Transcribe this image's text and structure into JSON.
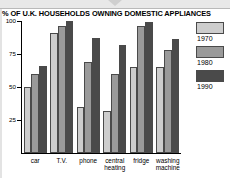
{
  "window": {
    "top_strip_nub": "drag-handle"
  },
  "chart_data": {
    "type": "bar",
    "title": "% OF U.K. HOUSEHOLDS OWNING DOMESTIC APPLIANCES",
    "xlabel": "",
    "ylabel": "",
    "ylim": [
      0,
      100
    ],
    "yticks": [
      25,
      50,
      75,
      100
    ],
    "ytick_labels": [
      "25",
      "50",
      "75",
      "100"
    ],
    "grid": false,
    "legend_position": "right",
    "categories": [
      "car",
      "T.V.",
      "phone",
      "central heating",
      "fridge",
      "washing machine"
    ],
    "category_labels": [
      {
        "line1": "car",
        "line2": ""
      },
      {
        "line1": "T.V.",
        "line2": ""
      },
      {
        "line1": "phone",
        "line2": ""
      },
      {
        "line1": "central",
        "line2": "heating"
      },
      {
        "line1": "fridge",
        "line2": ""
      },
      {
        "line1": "washing",
        "line2": "machine"
      }
    ],
    "series": [
      {
        "name": "1970",
        "color": "#cdcdcd",
        "values": [
          50,
          91,
          35,
          32,
          65,
          65
        ]
      },
      {
        "name": "1980",
        "color": "#9a9a9a",
        "values": [
          60,
          96,
          69,
          60,
          96,
          78
        ]
      },
      {
        "name": "1990",
        "color": "#4a4a4a",
        "values": [
          66,
          100,
          87,
          82,
          99,
          86
        ]
      }
    ]
  },
  "legend": {
    "entries": [
      {
        "label": "1970",
        "color": "#cdcdcd"
      },
      {
        "label": "1980",
        "color": "#9a9a9a"
      },
      {
        "label": "1990",
        "color": "#4a4a4a"
      }
    ]
  }
}
